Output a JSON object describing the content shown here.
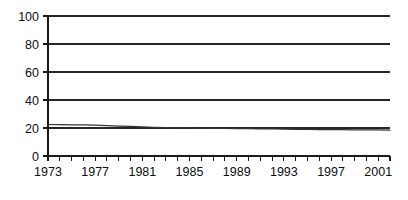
{
  "chart_data": {
    "type": "line",
    "title": "",
    "subtitle": "",
    "xlabel": "",
    "ylabel": "",
    "xlim": [
      1973,
      2002
    ],
    "ylim": [
      0,
      100
    ],
    "grid": true,
    "grid_axis": "y",
    "legend": false,
    "legend_position": "none",
    "y_ticks": [
      0,
      20,
      40,
      60,
      80,
      100
    ],
    "y_tick_labels": [
      "0",
      "20",
      "40",
      "60",
      "80",
      "100"
    ],
    "x_ticks": [
      1973,
      1974,
      1975,
      1976,
      1977,
      1978,
      1979,
      1980,
      1981,
      1982,
      1983,
      1984,
      1985,
      1986,
      1987,
      1988,
      1989,
      1990,
      1991,
      1992,
      1993,
      1994,
      1995,
      1996,
      1997,
      1998,
      1999,
      2000,
      2001,
      2002
    ],
    "x_tick_labels": [
      "1973",
      "1977",
      "1981",
      "1985",
      "1989",
      "1993",
      "1997",
      "2001"
    ],
    "x_labeled_ticks": [
      1973,
      1977,
      1981,
      1985,
      1989,
      1993,
      1997,
      2001
    ],
    "series": [
      {
        "name": "series-1",
        "color": "#333333",
        "x": [
          1973,
          1974,
          1975,
          1976,
          1977,
          1978,
          1979,
          1980,
          1981,
          1982,
          1983,
          1984,
          1985,
          1986,
          1987,
          1988,
          1989,
          1990,
          1991,
          1992,
          1993,
          1994,
          1995,
          1996,
          1997,
          1998,
          1999,
          2000,
          2001,
          2002
        ],
        "values": [
          22.5,
          22.4,
          22.3,
          22.2,
          22.0,
          21.7,
          21.4,
          21.1,
          20.8,
          20.5,
          20.3,
          20.1,
          20.0,
          19.9,
          19.8,
          19.7,
          19.6,
          19.5,
          19.4,
          19.3,
          19.2,
          19.1,
          19.0,
          18.9,
          18.9,
          18.8,
          18.7,
          18.7,
          18.6,
          18.5
        ]
      }
    ],
    "annotations": []
  },
  "layout": {
    "plot_left": 48,
    "plot_right": 390,
    "plot_top": 16,
    "plot_bottom": 156,
    "tick_length": 5,
    "x_label_y": 176,
    "width": 408,
    "height": 200
  },
  "colors": {
    "background": "#ffffff",
    "axis": "#1a1a1a",
    "grid": "#262626",
    "series": "#333333",
    "text": "#0d0d0d"
  }
}
